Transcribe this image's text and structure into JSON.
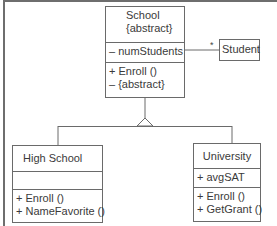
{
  "diagram": {
    "type": "UML class diagram",
    "classes": {
      "school": {
        "name": "School",
        "stereotype": "{abstract}",
        "attributes": [
          "– numStudents"
        ],
        "operations": [
          "+ Enroll ()",
          "– {abstract}"
        ]
      },
      "student": {
        "name": "Student"
      },
      "high_school": {
        "name": "High School",
        "attributes": [],
        "operations": [
          "+ Enroll ()",
          "+ NameFavorite ()"
        ]
      },
      "university": {
        "name": "University",
        "attributes": [
          "+ avgSAT"
        ],
        "operations": [
          "+ Enroll ()",
          "+ GetGrant ()"
        ]
      }
    },
    "relationships": [
      {
        "type": "association",
        "from": "School",
        "to": "Student",
        "multiplicity": "*"
      },
      {
        "type": "generalization",
        "from": "High School",
        "to": "School"
      },
      {
        "type": "generalization",
        "from": "University",
        "to": "School"
      }
    ],
    "association_multiplicity": "*",
    "line_color": "#6a6a6a",
    "text_color": "#3a3a3a"
  }
}
